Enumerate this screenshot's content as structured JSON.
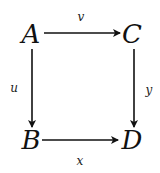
{
  "diagram": {
    "type": "commutative-square",
    "nodes": {
      "top_left": "A",
      "top_right": "C",
      "bottom_left": "B",
      "bottom_right": "D"
    },
    "arrows": [
      {
        "from": "A",
        "to": "C",
        "label": "v"
      },
      {
        "from": "A",
        "to": "B",
        "label": "u"
      },
      {
        "from": "C",
        "to": "D",
        "label": "y"
      },
      {
        "from": "B",
        "to": "D",
        "label": "x"
      }
    ],
    "labels": {
      "top": "v",
      "left": "u",
      "right": "y",
      "bottom": "x"
    },
    "colors": {
      "ink": "#111111",
      "background": "#ffffff"
    }
  }
}
